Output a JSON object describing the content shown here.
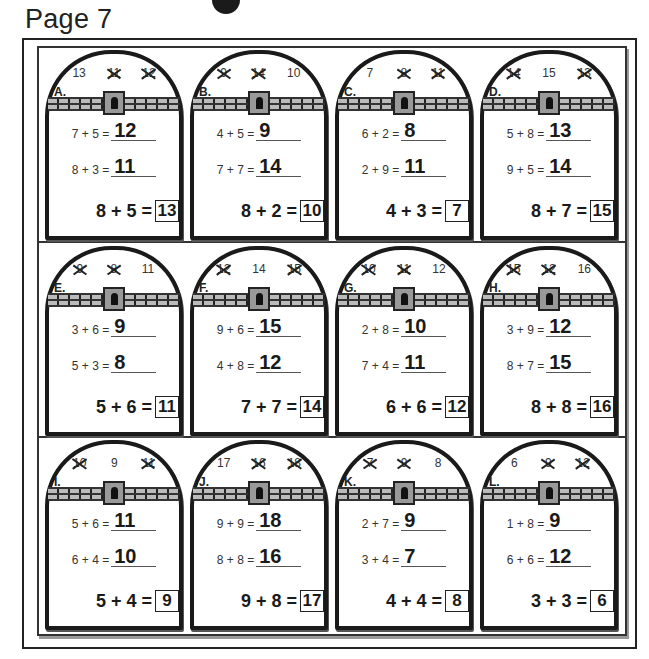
{
  "page": {
    "title": "Page 7"
  },
  "cards": [
    {
      "letter": "A.",
      "top_numbers": [
        {
          "value": "13",
          "crossed": false
        },
        {
          "value": "11",
          "crossed": true
        },
        {
          "value": "12",
          "crossed": true
        }
      ],
      "problems": [
        {
          "expr": "7 + 5 =",
          "answer": "12"
        },
        {
          "expr": "8 + 3 =",
          "answer": "11"
        }
      ],
      "final": {
        "expr": "8 + 5 =",
        "answer": "13"
      }
    },
    {
      "letter": "B.",
      "top_numbers": [
        {
          "value": "9",
          "crossed": true
        },
        {
          "value": "14",
          "crossed": true
        },
        {
          "value": "10",
          "crossed": false
        }
      ],
      "problems": [
        {
          "expr": "4 + 5 =",
          "answer": "9"
        },
        {
          "expr": "7 + 7 =",
          "answer": "14"
        }
      ],
      "final": {
        "expr": "8 + 2 =",
        "answer": "10"
      }
    },
    {
      "letter": "C.",
      "top_numbers": [
        {
          "value": "7",
          "crossed": false
        },
        {
          "value": "8",
          "crossed": true
        },
        {
          "value": "11",
          "crossed": true
        }
      ],
      "problems": [
        {
          "expr": "6 + 2 =",
          "answer": "8"
        },
        {
          "expr": "2 + 9 =",
          "answer": "11"
        }
      ],
      "final": {
        "expr": "4 + 3 =",
        "answer": "7"
      }
    },
    {
      "letter": "D.",
      "top_numbers": [
        {
          "value": "14",
          "crossed": true
        },
        {
          "value": "15",
          "crossed": false
        },
        {
          "value": "13",
          "crossed": true
        }
      ],
      "problems": [
        {
          "expr": "5 + 8 =",
          "answer": "13"
        },
        {
          "expr": "9 + 5 =",
          "answer": "14"
        }
      ],
      "final": {
        "expr": "8 + 7 =",
        "answer": "15"
      }
    },
    {
      "letter": "E.",
      "top_numbers": [
        {
          "value": "9",
          "crossed": true
        },
        {
          "value": "8",
          "crossed": true
        },
        {
          "value": "11",
          "crossed": false
        }
      ],
      "problems": [
        {
          "expr": "3 + 6 =",
          "answer": "9"
        },
        {
          "expr": "5 + 3 =",
          "answer": "8"
        }
      ],
      "final": {
        "expr": "5 + 6 =",
        "answer": "11"
      }
    },
    {
      "letter": "F.",
      "top_numbers": [
        {
          "value": "12",
          "crossed": true
        },
        {
          "value": "14",
          "crossed": false
        },
        {
          "value": "15",
          "crossed": true
        }
      ],
      "problems": [
        {
          "expr": "9 + 6 =",
          "answer": "15"
        },
        {
          "expr": "4 + 8 =",
          "answer": "12"
        }
      ],
      "final": {
        "expr": "7 + 7 =",
        "answer": "14"
      }
    },
    {
      "letter": "G.",
      "top_numbers": [
        {
          "value": "10",
          "crossed": true
        },
        {
          "value": "11",
          "crossed": true
        },
        {
          "value": "12",
          "crossed": false
        }
      ],
      "problems": [
        {
          "expr": "2 + 8 =",
          "answer": "10"
        },
        {
          "expr": "7 + 4 =",
          "answer": "11"
        }
      ],
      "final": {
        "expr": "6 + 6 =",
        "answer": "12"
      }
    },
    {
      "letter": "H.",
      "top_numbers": [
        {
          "value": "15",
          "crossed": true
        },
        {
          "value": "12",
          "crossed": true
        },
        {
          "value": "16",
          "crossed": false
        }
      ],
      "problems": [
        {
          "expr": "3 + 9 =",
          "answer": "12"
        },
        {
          "expr": "8 + 7 =",
          "answer": "15"
        }
      ],
      "final": {
        "expr": "8 + 8 =",
        "answer": "16"
      }
    },
    {
      "letter": "I.",
      "top_numbers": [
        {
          "value": "10",
          "crossed": true
        },
        {
          "value": "9",
          "crossed": false
        },
        {
          "value": "11",
          "crossed": true
        }
      ],
      "problems": [
        {
          "expr": "5 + 6 =",
          "answer": "11"
        },
        {
          "expr": "6 + 4 =",
          "answer": "10"
        }
      ],
      "final": {
        "expr": "5 + 4 =",
        "answer": "9"
      }
    },
    {
      "letter": "J.",
      "top_numbers": [
        {
          "value": "17",
          "crossed": false
        },
        {
          "value": "16",
          "crossed": true
        },
        {
          "value": "18",
          "crossed": true
        }
      ],
      "problems": [
        {
          "expr": "9 + 9 =",
          "answer": "18"
        },
        {
          "expr": "8 + 8 =",
          "answer": "16"
        }
      ],
      "final": {
        "expr": "9 + 8 =",
        "answer": "17"
      }
    },
    {
      "letter": "K.",
      "top_numbers": [
        {
          "value": "7",
          "crossed": true
        },
        {
          "value": "9",
          "crossed": true
        },
        {
          "value": "8",
          "crossed": false
        }
      ],
      "problems": [
        {
          "expr": "2 + 7 =",
          "answer": "9"
        },
        {
          "expr": "3 + 4 =",
          "answer": "7"
        }
      ],
      "final": {
        "expr": "4 + 4 =",
        "answer": "8"
      }
    },
    {
      "letter": "L.",
      "top_numbers": [
        {
          "value": "6",
          "crossed": false
        },
        {
          "value": "9",
          "crossed": true
        },
        {
          "value": "12",
          "crossed": true
        }
      ],
      "problems": [
        {
          "expr": "1 + 8 =",
          "answer": "9"
        },
        {
          "expr": "6 + 6 =",
          "answer": "12"
        }
      ],
      "final": {
        "expr": "3 + 3 =",
        "answer": "6"
      }
    }
  ]
}
